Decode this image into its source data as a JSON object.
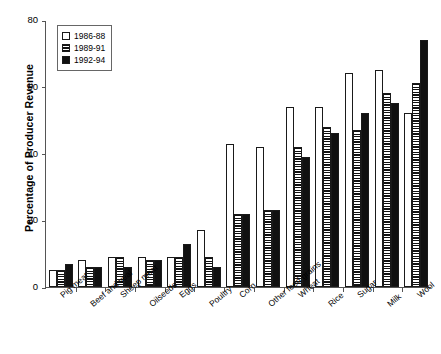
{
  "chart_data": {
    "type": "bar",
    "title": "",
    "xlabel": "",
    "ylabel": "Percentage of Producer Revenue",
    "ylim": [
      0,
      80
    ],
    "yticks": [
      0,
      20,
      40,
      60,
      80
    ],
    "grid": false,
    "legend_position": "top-left",
    "categories": [
      "Pig meat",
      "Beef and veal",
      "Sheep meat",
      "Oilseeds",
      "Eggs",
      "Poultry",
      "Corn",
      "Other feed grains",
      "Wheat",
      "Rice",
      "Sugar",
      "Milk",
      "Wool"
    ],
    "series": [
      {
        "name": "1986-88",
        "fill": "white",
        "values": [
          5,
          8,
          9,
          9,
          9,
          17,
          43,
          42,
          54,
          54,
          64,
          65,
          52
        ]
      },
      {
        "name": "1989-91",
        "fill": "horizontal-hatch",
        "values": [
          5,
          6,
          9,
          8,
          9,
          9,
          22,
          23,
          42,
          48,
          47,
          58,
          61
        ]
      },
      {
        "name": "1992-94",
        "fill": "black",
        "values": [
          7,
          6,
          6,
          8,
          13,
          6,
          22,
          23,
          39,
          46,
          52,
          55,
          74
        ]
      }
    ]
  },
  "legend": {
    "entries": [
      "1986-88",
      "1989-91",
      "1992-94"
    ]
  },
  "axis": {
    "y_tick_labels": [
      "0",
      "20",
      "40",
      "60",
      "80"
    ]
  }
}
